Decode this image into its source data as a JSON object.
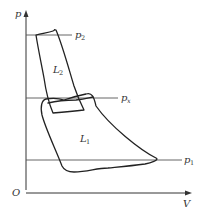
{
  "diagram": {
    "type": "p-V indicator diagram (two-stage compression)",
    "axes": {
      "y_label": "p",
      "x_label": "V",
      "origin_label": "O"
    },
    "pressure_lines": [
      {
        "id": "p2",
        "base": "p",
        "sub": "2"
      },
      {
        "id": "px",
        "base": "p",
        "sub": "x"
      },
      {
        "id": "p1",
        "base": "p",
        "sub": "1"
      }
    ],
    "loops": [
      {
        "id": "L2",
        "base": "L",
        "sub": "2",
        "description": "high-pressure stage loop between p2 and px"
      },
      {
        "id": "L1",
        "base": "L",
        "sub": "1",
        "description": "low-pressure stage loop between px and p1"
      }
    ],
    "colors": {
      "line": "#222222",
      "axis": "#333333",
      "background": "#ffffff"
    }
  }
}
